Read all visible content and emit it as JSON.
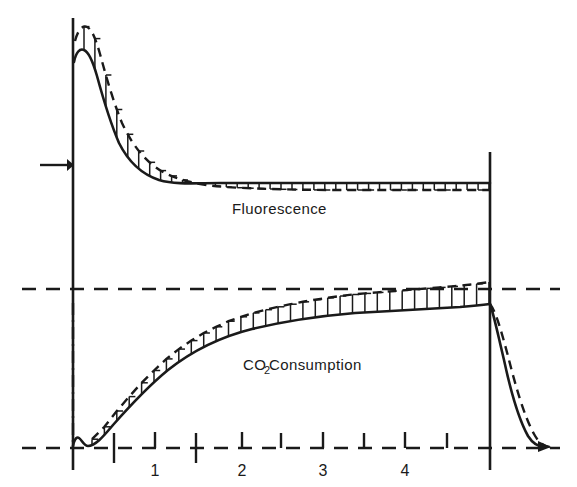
{
  "figure": {
    "title": "",
    "background_color": "#ffffff",
    "ink_color": "#1a1a1a",
    "width": 577,
    "height": 487
  },
  "labels": {
    "fluorescence": "Fluorescence",
    "co2_main": "CO",
    "co2_sub": "2",
    "co2_rest": " Consumption"
  },
  "axes": {
    "x_tick_labels": [
      "1",
      "2",
      "3",
      "4"
    ],
    "x_tick_label_positions": [
      155,
      242,
      323,
      405
    ],
    "x_minor_tick_positions": [
      114,
      196,
      281,
      364,
      447
    ],
    "x_major_tick_positions": [
      155,
      242,
      323,
      405
    ],
    "baseline_y": 448,
    "mid_dashed_y": 289,
    "left_axis_x": 73,
    "right_axis_x": 490,
    "onset_arrow_y": 165
  },
  "chart_data": {
    "type": "line",
    "title": "",
    "xlabel": "",
    "ylabel": "",
    "xlim": [
      -0.9,
      5.8
    ],
    "ylim": [
      0,
      1
    ],
    "grid": false,
    "legend": "inline-annotations",
    "annotations": [
      {
        "text": "Fluorescence",
        "x": 2.25,
        "y": 0.78
      },
      {
        "text": "CO2 Consumption",
        "x": 2.55,
        "y": 0.27
      },
      {
        "text": "onset-arrow",
        "x": -0.45,
        "y": 0.81
      },
      {
        "text": "illumination-on",
        "x": 0.0,
        "y": null
      },
      {
        "text": "illumination-off",
        "x": 4.95,
        "y": null
      }
    ],
    "series": [
      {
        "name": "Fluorescence (solid, lower envelope)",
        "style": "solid",
        "x": [
          0.0,
          0.05,
          0.1,
          0.15,
          0.25,
          0.4,
          0.6,
          0.8,
          1.0,
          1.3,
          1.6,
          2.0,
          2.5,
          3.0,
          3.5,
          4.0,
          4.5,
          4.95
        ],
        "y": [
          0.895,
          0.935,
          0.925,
          0.895,
          0.83,
          0.74,
          0.655,
          0.6,
          0.565,
          0.545,
          0.538,
          0.534,
          0.532,
          0.531,
          0.531,
          0.531,
          0.531,
          0.531
        ]
      },
      {
        "name": "Fluorescence (dashed, upper envelope)",
        "style": "dashed",
        "x": [
          0.0,
          0.05,
          0.1,
          0.18,
          0.3,
          0.45,
          0.65,
          0.9,
          1.2,
          1.5,
          2.0,
          2.5,
          3.0,
          3.5,
          4.0,
          4.5,
          4.95
        ],
        "y": [
          0.94,
          0.985,
          0.98,
          0.955,
          0.9,
          0.82,
          0.735,
          0.665,
          0.615,
          0.595,
          0.578,
          0.572,
          0.569,
          0.567,
          0.566,
          0.565,
          0.565
        ]
      },
      {
        "name": "CO2 Consumption (solid, lower envelope)",
        "style": "solid",
        "x": [
          0.0,
          0.04,
          0.08,
          0.14,
          0.22,
          0.35,
          0.55,
          0.8,
          1.1,
          1.5,
          2.0,
          2.5,
          3.0,
          3.5,
          4.0,
          4.5,
          4.95,
          5.05,
          5.2,
          5.4,
          5.7
        ],
        "y": [
          0.005,
          0.028,
          0.012,
          0.02,
          0.05,
          0.1,
          0.165,
          0.225,
          0.275,
          0.315,
          0.345,
          0.36,
          0.37,
          0.376,
          0.381,
          0.386,
          0.392,
          0.3,
          0.14,
          0.045,
          0.005
        ]
      },
      {
        "name": "CO2 Consumption (dashed, upper envelope)",
        "style": "dashed",
        "x": [
          4.95,
          5.08,
          5.25,
          5.45,
          5.75
        ],
        "y": [
          0.392,
          0.325,
          0.175,
          0.065,
          0.008
        ]
      }
    ],
    "hatching": {
      "description": "vertical hatch lines filling the band between solid and dashed envelopes of both curves",
      "fluorescence_count": 38,
      "co2_count": 33
    }
  }
}
